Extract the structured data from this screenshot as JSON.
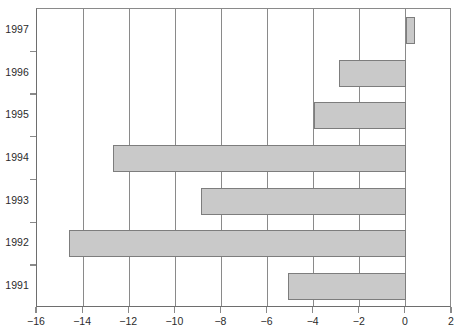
{
  "chart_data": {
    "type": "bar",
    "orientation": "horizontal",
    "title": "",
    "subtitle": "",
    "xlabel": "",
    "ylabel": "",
    "categories": [
      "1991",
      "1992",
      "1993",
      "1994",
      "1995",
      "1996",
      "1997"
    ],
    "values": [
      -5.1,
      -14.6,
      -8.9,
      -12.7,
      -4.0,
      -2.9,
      0.4
    ],
    "series": [
      {
        "name": "",
        "values": [
          -5.1,
          -14.6,
          -8.9,
          -12.7,
          -4.0,
          -2.9,
          0.4
        ]
      }
    ],
    "xlim": [
      -16,
      2
    ],
    "ylim": [
      0,
      7
    ],
    "x_ticks": [
      -16,
      -14,
      -12,
      -10,
      -8,
      -6,
      -4,
      -2,
      0,
      2
    ],
    "x_tick_labels": [
      "−16",
      "−14",
      "−12",
      "−10",
      "−8",
      "−6",
      "−4",
      "−2",
      "0",
      "2"
    ],
    "y_tick_labels": [
      "1997",
      "1996",
      "1995",
      "1994",
      "1993",
      "1992",
      "1991"
    ],
    "grid": "vertical",
    "legend": "none",
    "bar_fill_color": "#c9c9c9",
    "bar_border_color": "#7d7d7d",
    "axis_color": "#8a8a8a",
    "text_color": "#2b2b2b",
    "background_color": "#ffffff",
    "category_order_top_to_bottom": [
      "1997",
      "1996",
      "1995",
      "1994",
      "1993",
      "1992",
      "1991"
    ]
  }
}
